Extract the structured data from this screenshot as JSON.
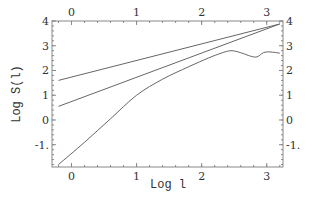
{
  "chart_data": {
    "type": "line",
    "title": "",
    "xlabel": "Log l",
    "ylabel": "Log S(l)",
    "xlim": [
      -0.3,
      3.25
    ],
    "ylim": [
      -1.9,
      4
    ],
    "grid": false,
    "legend": null,
    "x_ticks": [
      "0",
      "1",
      "2",
      "3"
    ],
    "x_tick_values": [
      0,
      1,
      2,
      3
    ],
    "y_ticks_left": [
      "4",
      "3",
      "2",
      "1",
      "0",
      "-1."
    ],
    "y_ticks_right": [
      "4",
      "3",
      "2",
      "1",
      "0",
      "-1."
    ],
    "y_tick_values": [
      4,
      3,
      2,
      1,
      0,
      -1
    ],
    "series": [
      {
        "name": "upper-line",
        "x": [
          -0.2,
          3.2
        ],
        "y": [
          1.6,
          3.88
        ]
      },
      {
        "name": "middle-line",
        "x": [
          -0.2,
          3.2
        ],
        "y": [
          0.55,
          3.88
        ]
      },
      {
        "name": "measured-curve",
        "x": [
          -0.2,
          0.2,
          0.6,
          1.0,
          1.4,
          1.8,
          2.1,
          2.3,
          2.45,
          2.6,
          2.75,
          2.85,
          2.95,
          3.05,
          3.2
        ],
        "y": [
          -1.8,
          -0.9,
          0.05,
          1.0,
          1.65,
          2.15,
          2.5,
          2.7,
          2.8,
          2.72,
          2.58,
          2.55,
          2.72,
          2.75,
          2.7
        ]
      }
    ]
  }
}
